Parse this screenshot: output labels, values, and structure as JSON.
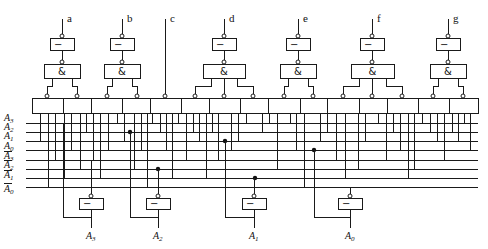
{
  "diagram": {
    "segments": [
      {
        "label": "a",
        "x": 62,
        "inputs": [
          47,
          77
        ]
      },
      {
        "label": "b",
        "x": 122,
        "inputs": [
          107,
          137
        ]
      },
      {
        "label": "c",
        "x": 165,
        "inputs": [
          165
        ],
        "direct": true
      },
      {
        "label": "d",
        "x": 224,
        "inputs": [
          195,
          224,
          253
        ]
      },
      {
        "label": "e",
        "x": 298,
        "inputs": [
          284,
          313
        ]
      },
      {
        "label": "f",
        "x": 372,
        "inputs": [
          343,
          372,
          402
        ]
      },
      {
        "label": "g",
        "x": 448,
        "inputs": [
          433,
          463
        ]
      }
    ],
    "gate_symbols": {
      "not": "−",
      "and": "&"
    },
    "or_array": {
      "left": 32,
      "right": 478,
      "top": 98,
      "bottom": 113,
      "dividers": [
        63,
        91,
        122,
        150,
        181,
        209,
        240,
        268,
        300,
        327,
        359,
        387,
        418,
        449
      ]
    },
    "rows": [
      {
        "name": "A3",
        "sub": "3",
        "bar": false,
        "y": 123
      },
      {
        "name": "A2",
        "sub": "2",
        "bar": false,
        "y": 132
      },
      {
        "name": "A1",
        "sub": "1",
        "bar": false,
        "y": 141
      },
      {
        "name": "A0",
        "sub": "0",
        "bar": false,
        "y": 150
      },
      {
        "name": "A3",
        "sub": "3",
        "bar": true,
        "y": 160
      },
      {
        "name": "A2",
        "sub": "2",
        "bar": true,
        "y": 169
      },
      {
        "name": "A1",
        "sub": "1",
        "bar": true,
        "y": 178
      },
      {
        "name": "A0",
        "sub": "0",
        "bar": true,
        "y": 187
      }
    ],
    "row_labels": {
      "r0": "A",
      "r0s": "3",
      "r1": "A",
      "r1s": "2",
      "r2": "A",
      "r2s": "1",
      "r3": "A",
      "r3s": "0",
      "r4": "A",
      "r4s": "3",
      "r5": "A",
      "r5s": "2",
      "r6": "A",
      "r6s": "1",
      "r7": "A",
      "r7s": "0"
    },
    "taps": [
      [
        40,
        2
      ],
      [
        48,
        7
      ],
      [
        55,
        4
      ],
      [
        64,
        6
      ],
      [
        71,
        3
      ],
      [
        80,
        5
      ],
      [
        86,
        1
      ],
      [
        93,
        4
      ],
      [
        100,
        6
      ],
      [
        108,
        3
      ],
      [
        117,
        0
      ],
      [
        124,
        2
      ],
      [
        134,
        5
      ],
      [
        141,
        3
      ],
      [
        147,
        7
      ],
      [
        152,
        0
      ],
      [
        160,
        1
      ],
      [
        166,
        3
      ],
      [
        172,
        6
      ],
      [
        178,
        0
      ],
      [
        186,
        4
      ],
      [
        193,
        1
      ],
      [
        199,
        2
      ],
      [
        206,
        6
      ],
      [
        212,
        1
      ],
      [
        218,
        4
      ],
      [
        231,
        3
      ],
      [
        238,
        2
      ],
      [
        246,
        0
      ],
      [
        262,
        1
      ],
      [
        269,
        0
      ],
      [
        277,
        5
      ],
      [
        290,
        0
      ],
      [
        296,
        3
      ],
      [
        304,
        7
      ],
      [
        320,
        2
      ],
      [
        327,
        1
      ],
      [
        336,
        4
      ],
      [
        345,
        6
      ],
      [
        358,
        5
      ],
      [
        365,
        2
      ],
      [
        378,
        0
      ],
      [
        386,
        4
      ],
      [
        393,
        1
      ],
      [
        400,
        3
      ],
      [
        408,
        6
      ],
      [
        414,
        5
      ],
      [
        422,
        0
      ],
      [
        430,
        1
      ],
      [
        437,
        2
      ],
      [
        444,
        4
      ],
      [
        452,
        1
      ],
      [
        458,
        2
      ],
      [
        464,
        0
      ],
      [
        470,
        3
      ]
    ],
    "dots": [
      [
        130,
        1
      ],
      [
        225,
        2
      ],
      [
        314,
        3
      ],
      [
        158,
        5
      ],
      [
        255,
        6
      ]
    ],
    "inputs": [
      {
        "label": "A",
        "sub": "3",
        "out_x": 91,
        "loop_x": 63,
        "row_true": 0,
        "row_bar": 4
      },
      {
        "label": "A",
        "sub": "2",
        "out_x": 158,
        "loop_x": 130,
        "row_true": 1,
        "row_bar": 5
      },
      {
        "label": "A",
        "sub": "1",
        "out_x": 254,
        "loop_x": 225,
        "row_true": 2,
        "row_bar": 6
      },
      {
        "label": "A",
        "sub": "0",
        "out_x": 350,
        "loop_x": 314,
        "row_true": 3,
        "row_bar": 7
      }
    ],
    "colors": {
      "line": "#1a1a1a",
      "background": "#ffffff"
    }
  }
}
